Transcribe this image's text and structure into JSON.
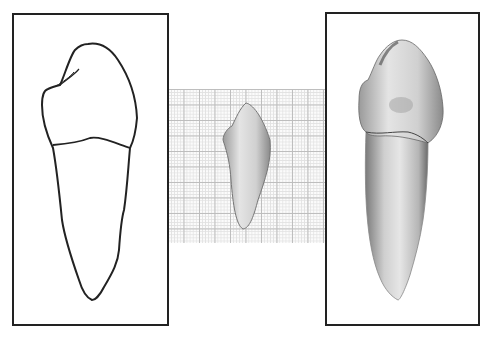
{
  "figure": {
    "panels": [
      {
        "name": "outline-drawing",
        "description": "Line drawing of tooth outline with crown and root"
      },
      {
        "name": "photo-on-grid",
        "description": "Small photograph of tooth on millimeter graph paper"
      },
      {
        "name": "shaded-illustration",
        "description": "Shaded illustration of tooth with crown and root"
      }
    ],
    "colors": {
      "stroke": "#222222",
      "grid_major": "#bdbdbd",
      "grid_minor": "#e2e2e2"
    }
  }
}
